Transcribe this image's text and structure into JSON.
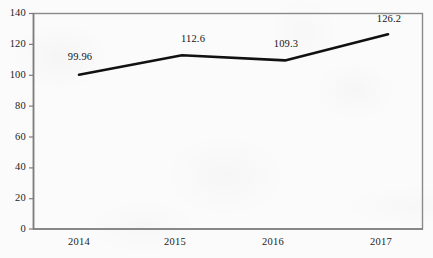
{
  "chart_data": {
    "type": "line",
    "title": "",
    "xlabel": "",
    "ylabel": "",
    "categories": [
      "2014",
      "2015",
      "2016",
      "2017"
    ],
    "values": [
      99.96,
      112.6,
      109.3,
      126.2
    ],
    "point_labels": [
      "99.96",
      "112.6",
      "109.3",
      "126.2"
    ],
    "series": [
      {
        "name": "",
        "values": [
          99.96,
          112.6,
          109.3,
          126.2
        ]
      }
    ],
    "ylim": [
      0,
      140
    ],
    "ytick_step": 20,
    "ytick_labels": [
      "0",
      "20",
      "40",
      "60",
      "80",
      "100",
      "120",
      "140"
    ],
    "ytick_values": [
      0,
      20,
      40,
      60,
      80,
      100,
      120,
      140
    ],
    "grid": false,
    "legend": false,
    "legend_position": "none",
    "markers": false,
    "line_color": "#111111",
    "line_width": 2.6,
    "frame_color": "#8a8a8a",
    "background_color": "#fbfbfb",
    "text_color": "#1b1b1b"
  }
}
